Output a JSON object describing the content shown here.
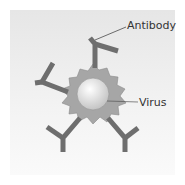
{
  "labels": {
    "antibody": "Antibody",
    "virus": "Virus"
  },
  "colors": {
    "antibody": "#6e6e6e",
    "coat": "#a8a8a8",
    "virus_light": "#ffffff",
    "virus_dark": "#c8c8c8",
    "background": "#ececec"
  }
}
